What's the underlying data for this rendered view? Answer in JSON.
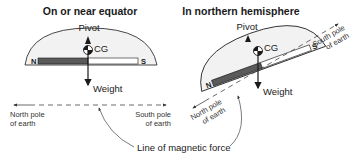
{
  "figure": {
    "left_panel": {
      "title": "On or near equator",
      "pivot_label": "Pivot",
      "cg_label": "CG",
      "weight_label": "Weight",
      "needle_north_label": "N",
      "needle_south_label": "S",
      "north_pole_line1": "North pole",
      "north_pole_line2": "of earth",
      "south_pole_line1": "South pole",
      "south_pole_line2": "of earth"
    },
    "right_panel": {
      "title": "In northern hemisphere",
      "pivot_label": "Pivot",
      "cg_label": "CG",
      "weight_label": "Weight",
      "needle_north_label": "N",
      "needle_south_label": "S",
      "north_pole_line1": "North pole",
      "north_pole_line2": "of earth",
      "south_pole_line1": "South pole",
      "south_pole_line2": "of earth"
    },
    "shared_label": "Line of magnetic force",
    "colors": {
      "dome_fill": "#f2f2f2",
      "needle_north": "#5a5a5a",
      "needle_south": "#ffffff",
      "stroke": "#1a1a1a",
      "dashed_line": "#444444"
    }
  }
}
